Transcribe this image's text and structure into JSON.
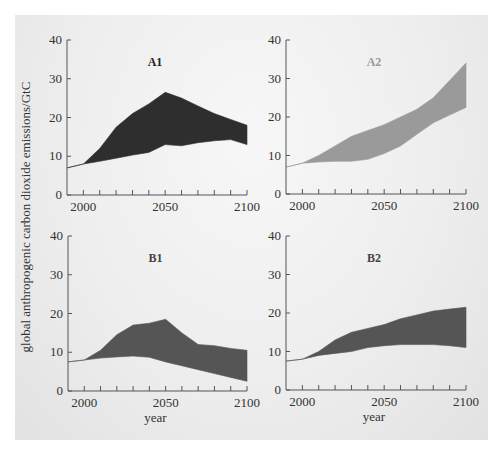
{
  "figure": {
    "ylabel": "global anthropogenic carbon dioxide emissions/GtC",
    "xlabel": "year"
  },
  "chart_data": [
    {
      "type": "area",
      "title": "A1",
      "xlabel": "",
      "ylabel": "global anthropogenic carbon dioxide emissions/GtC",
      "xlim": [
        1990,
        2100
      ],
      "ylim": [
        0,
        40
      ],
      "xticks": [
        2000,
        2050,
        2100
      ],
      "yticks": [
        0,
        10,
        20,
        30,
        40
      ],
      "fill_color": "#2e2e2e",
      "title_color": "#222222",
      "x": [
        1990,
        2000,
        2010,
        2020,
        2030,
        2040,
        2050,
        2060,
        2070,
        2080,
        2090,
        2100
      ],
      "series": [
        {
          "name": "upper",
          "values": [
            7,
            8,
            12,
            17.5,
            21,
            23.5,
            26.5,
            25,
            23,
            21,
            19.5,
            18
          ]
        },
        {
          "name": "lower",
          "values": [
            7,
            8,
            8.7,
            9.5,
            10.3,
            11,
            13,
            12.7,
            13.5,
            14,
            14.3,
            13
          ]
        }
      ]
    },
    {
      "type": "area",
      "title": "A2",
      "xlabel": "",
      "ylabel": "",
      "xlim": [
        1990,
        2100
      ],
      "ylim": [
        0,
        40
      ],
      "xticks": [
        2000,
        2050,
        2100
      ],
      "yticks": [
        0,
        10,
        20,
        30,
        40
      ],
      "fill_color": "#9a9a9a",
      "title_color": "#9a9a9a",
      "x": [
        1990,
        2000,
        2010,
        2020,
        2030,
        2040,
        2050,
        2060,
        2070,
        2080,
        2090,
        2100
      ],
      "series": [
        {
          "name": "upper",
          "values": [
            7,
            8,
            10,
            12.5,
            15,
            16.5,
            18,
            20,
            22,
            25,
            29.5,
            34
          ]
        },
        {
          "name": "lower",
          "values": [
            7,
            8,
            8.3,
            8.5,
            8.5,
            9,
            10.5,
            12.5,
            15.5,
            18.5,
            20.5,
            22.5
          ]
        }
      ]
    },
    {
      "type": "area",
      "title": "B1",
      "xlabel": "year",
      "ylabel": "",
      "xlim": [
        1990,
        2100
      ],
      "ylim": [
        0,
        40
      ],
      "xticks": [
        2000,
        2050,
        2100
      ],
      "yticks": [
        0,
        10,
        20,
        30,
        40
      ],
      "fill_color": "#555555",
      "title_color": "#444444",
      "x": [
        1990,
        2000,
        2010,
        2020,
        2030,
        2040,
        2050,
        2060,
        2070,
        2080,
        2090,
        2100
      ],
      "series": [
        {
          "name": "upper",
          "values": [
            7.5,
            8,
            10.5,
            14.5,
            17,
            17.5,
            18.5,
            15,
            12,
            11.7,
            11,
            10.5
          ]
        },
        {
          "name": "lower",
          "values": [
            7.5,
            8,
            8.5,
            8.8,
            9,
            8.7,
            7.5,
            6.5,
            5.5,
            4.5,
            3.5,
            2.5
          ]
        }
      ]
    },
    {
      "type": "area",
      "title": "B2",
      "xlabel": "year",
      "ylabel": "",
      "xlim": [
        1990,
        2100
      ],
      "ylim": [
        0,
        40
      ],
      "xticks": [
        2000,
        2050,
        2100
      ],
      "yticks": [
        0,
        10,
        20,
        30,
        40
      ],
      "fill_color": "#555555",
      "title_color": "#444444",
      "x": [
        1990,
        2000,
        2010,
        2020,
        2030,
        2040,
        2050,
        2060,
        2070,
        2080,
        2090,
        2100
      ],
      "series": [
        {
          "name": "upper",
          "values": [
            7.5,
            8,
            10,
            13,
            15,
            16,
            17,
            18.5,
            19.5,
            20.5,
            21,
            21.5
          ]
        },
        {
          "name": "lower",
          "values": [
            7.5,
            8,
            9,
            9.5,
            10,
            11,
            11.5,
            11.8,
            11.8,
            11.8,
            11.5,
            11
          ]
        }
      ]
    }
  ]
}
